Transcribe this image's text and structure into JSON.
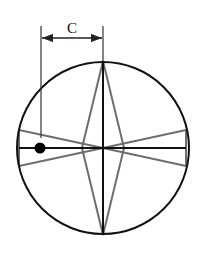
{
  "diagram": {
    "dimension_label": "C",
    "colors": {
      "circle": "#111111",
      "axes": "#111111",
      "cross_lines": "#6e6e6e",
      "dot": "#000000",
      "dimension": "#222222"
    },
    "elements": [
      "outer-circle",
      "vertical-axis",
      "horizontal-axis",
      "gray-diamond",
      "gray-bowtie",
      "marker-dot",
      "dimension-C"
    ]
  }
}
